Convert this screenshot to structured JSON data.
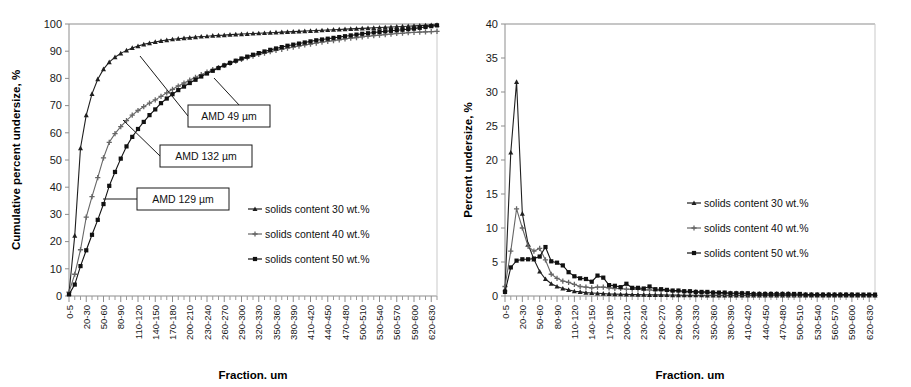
{
  "figure": {
    "panels": [
      "cumulative-undersize-chart",
      "percent-undersize-chart"
    ]
  },
  "chart_data": [
    {
      "id": "left",
      "type": "line",
      "title": "",
      "xlabel": "Fraction. um",
      "ylabel": "Cumulative percent undersize, %",
      "ylim": [
        0,
        100
      ],
      "ytick_labels": [
        "0",
        "10",
        "20",
        "30",
        "40",
        "50",
        "60",
        "70",
        "80",
        "90",
        "100"
      ],
      "yticks": [
        0,
        10,
        20,
        30,
        40,
        50,
        60,
        70,
        80,
        90,
        100
      ],
      "grid": false,
      "legend_position": "right-middle",
      "categories": [
        "0-5",
        "5-10",
        "10-20",
        "20-30",
        "30-40",
        "40-50",
        "50-60",
        "60-70",
        "70-80",
        "80-90",
        "90-100",
        "100-110",
        "110-120",
        "120-130",
        "130-140",
        "140-150",
        "150-160",
        "160-170",
        "170-180",
        "180-190",
        "190-200",
        "200-210",
        "210-220",
        "220-230",
        "230-240",
        "240-250",
        "250-260",
        "260-270",
        "270-280",
        "280-290",
        "290-300",
        "300-310",
        "310-320",
        "320-330",
        "330-340",
        "340-350",
        "350-360",
        "360-370",
        "370-380",
        "380-390",
        "390-400",
        "400-410",
        "410-420",
        "420-430",
        "430-440",
        "440-450",
        "450-460",
        "460-470",
        "470-480",
        "480-490",
        "490-500",
        "500-510",
        "510-520",
        "520-530",
        "530-540",
        "540-550",
        "550-560",
        "560-570",
        "570-580",
        "580-590",
        "590-600",
        "600-610",
        "610-620",
        "620-630",
        "630-640"
      ],
      "xtick_labels": [
        "0-5",
        "20-30",
        "50-60",
        "80-90",
        "110-120",
        "140-150",
        "170-180",
        "200-210",
        "230-240",
        "260-270",
        "290-300",
        "320-330",
        "350-360",
        "380-390",
        "410-420",
        "440-450",
        "470-480",
        "500-510",
        "530-540",
        "560-570",
        "590-600",
        "620-630"
      ],
      "xtick_indices": [
        0,
        3,
        6,
        9,
        12,
        15,
        18,
        21,
        24,
        27,
        30,
        33,
        36,
        39,
        42,
        45,
        48,
        51,
        54,
        57,
        60,
        63
      ],
      "series": [
        {
          "name": "solids content 30 wt.%",
          "marker": "triangle",
          "color": "#1f1f1f",
          "values": [
            1.0,
            22.2,
            54.4,
            66.5,
            74.3,
            79.7,
            83.4,
            86.0,
            87.8,
            89.2,
            90.3,
            91.2,
            91.9,
            92.5,
            93.0,
            93.4,
            93.8,
            94.1,
            94.4,
            94.6,
            94.8,
            95.0,
            95.2,
            95.4,
            95.5,
            95.7,
            95.8,
            95.9,
            96.1,
            96.2,
            96.3,
            96.4,
            96.5,
            96.6,
            96.7,
            96.8,
            96.9,
            97.0,
            97.1,
            97.2,
            97.3,
            97.4,
            97.5,
            97.6,
            97.7,
            97.8,
            97.9,
            98.0,
            98.1,
            98.2,
            98.3,
            98.4,
            98.5,
            98.6,
            98.7,
            98.8,
            98.9,
            99.0,
            99.1,
            99.2,
            99.3,
            99.4,
            99.5,
            99.6,
            99.7
          ]
        },
        {
          "name": "solids content 40 wt.%",
          "marker": "cross",
          "color": "#666666",
          "values": [
            1.4,
            8.0,
            17.0,
            29.0,
            36.5,
            43.5,
            50.8,
            56.5,
            59.7,
            62.3,
            64.5,
            66.5,
            68.2,
            69.6,
            70.9,
            72.1,
            73.4,
            74.7,
            76.0,
            77.2,
            78.3,
            79.4,
            80.4,
            81.4,
            82.3,
            83.2,
            84.0,
            84.8,
            85.6,
            86.3,
            87.0,
            87.6,
            88.2,
            88.8,
            89.3,
            89.8,
            90.3,
            90.7,
            91.1,
            91.5,
            91.9,
            92.3,
            92.6,
            93.0,
            93.3,
            93.6,
            93.9,
            94.2,
            94.5,
            94.8,
            95.0,
            95.3,
            95.5,
            95.7,
            95.9,
            96.1,
            96.3,
            96.5,
            96.6,
            96.8,
            96.9,
            97.0,
            97.1,
            97.2,
            97.3
          ]
        },
        {
          "name": "solids content 50 wt.%",
          "marker": "square",
          "color": "#111111",
          "values": [
            0.6,
            4.2,
            11.0,
            16.8,
            22.5,
            28.0,
            33.8,
            40.5,
            45.6,
            50.5,
            55.0,
            58.5,
            61.4,
            64.0,
            66.5,
            68.6,
            70.9,
            72.6,
            74.2,
            75.7,
            77.0,
            78.3,
            79.5,
            80.7,
            81.8,
            82.8,
            83.8,
            84.8,
            85.7,
            86.5,
            87.3,
            88.0,
            88.7,
            89.3,
            89.9,
            90.5,
            91.0,
            91.5,
            92.0,
            92.4,
            92.8,
            93.2,
            93.6,
            94.0,
            94.3,
            94.6,
            94.9,
            95.2,
            95.5,
            95.8,
            96.1,
            96.4,
            96.6,
            96.9,
            97.1,
            97.3,
            97.5,
            97.7,
            97.9,
            98.1,
            98.3,
            98.6,
            98.9,
            99.2,
            99.5
          ]
        }
      ],
      "annotations": [
        {
          "label": "AMD 49 µm",
          "box": {
            "x": 188,
            "y": 105,
            "w": 82,
            "h": 22
          },
          "leader": [
            [
              140,
              56
            ],
            [
              188,
              116
            ]
          ]
        },
        {
          "label": "AMD 132 µm",
          "box": {
            "x": 160,
            "y": 145,
            "w": 92,
            "h": 22
          },
          "leader": [
            [
              123,
              120
            ],
            [
              160,
              156
            ]
          ]
        },
        {
          "label": "AMD 129 µm",
          "box": {
            "x": 137,
            "y": 188,
            "w": 92,
            "h": 22
          },
          "leader": [
            [
              103,
              199
            ],
            [
              137,
              199
            ]
          ]
        }
      ],
      "extra_leaders": [
        [
          [
            240,
            106
          ],
          [
            214,
            78
          ]
        ]
      ]
    },
    {
      "id": "right",
      "type": "line",
      "title": "",
      "xlabel": "Fraction. um",
      "ylabel": "Percent undersize, %",
      "ylim": [
        0,
        40
      ],
      "ytick_labels": [
        "0",
        "5",
        "10",
        "15",
        "20",
        "25",
        "30",
        "35",
        "40"
      ],
      "yticks": [
        0,
        5,
        10,
        15,
        20,
        25,
        30,
        35,
        40
      ],
      "grid": false,
      "legend_position": "right-middle",
      "categories": [
        "0-5",
        "5-10",
        "10-20",
        "20-30",
        "30-40",
        "40-50",
        "50-60",
        "60-70",
        "70-80",
        "80-90",
        "90-100",
        "100-110",
        "110-120",
        "120-130",
        "130-140",
        "140-150",
        "150-160",
        "160-170",
        "170-180",
        "180-190",
        "190-200",
        "200-210",
        "210-220",
        "220-230",
        "230-240",
        "240-250",
        "250-260",
        "260-270",
        "270-280",
        "280-290",
        "290-300",
        "300-310",
        "310-320",
        "320-330",
        "330-340",
        "340-350",
        "350-360",
        "360-370",
        "370-380",
        "380-390",
        "390-400",
        "400-410",
        "410-420",
        "420-430",
        "430-440",
        "440-450",
        "450-460",
        "460-470",
        "470-480",
        "480-490",
        "490-500",
        "500-510",
        "510-520",
        "520-530",
        "530-540",
        "540-550",
        "550-560",
        "560-570",
        "570-580",
        "580-590",
        "590-600",
        "600-610",
        "610-620",
        "620-630",
        "630-640"
      ],
      "xtick_labels": [
        "0-5",
        "20-30",
        "50-60",
        "80-90",
        "110-120",
        "140-150",
        "170-180",
        "200-210",
        "230-240",
        "260-270",
        "290-300",
        "320-330",
        "350-360",
        "380-390",
        "410-420",
        "440-450",
        "470-480",
        "500-510",
        "530-540",
        "560-570",
        "590-600",
        "620-630"
      ],
      "xtick_indices": [
        0,
        3,
        6,
        9,
        12,
        15,
        18,
        21,
        24,
        27,
        30,
        33,
        36,
        39,
        42,
        45,
        48,
        51,
        54,
        57,
        60,
        63
      ],
      "series": [
        {
          "name": "solids content 30 wt.%",
          "marker": "triangle",
          "color": "#1f1f1f",
          "values": [
            1.0,
            21.1,
            31.5,
            12.1,
            7.6,
            5.4,
            3.6,
            2.5,
            1.8,
            1.4,
            1.1,
            0.9,
            0.7,
            0.6,
            0.5,
            0.45,
            0.4,
            0.35,
            0.3,
            0.28,
            0.26,
            0.24,
            0.22,
            0.2,
            0.19,
            0.18,
            0.17,
            0.16,
            0.15,
            0.14,
            0.13,
            0.12,
            0.12,
            0.11,
            0.11,
            0.1,
            0.1,
            0.1,
            0.1,
            0.1,
            0.1,
            0.1,
            0.1,
            0.1,
            0.1,
            0.1,
            0.1,
            0.1,
            0.1,
            0.1,
            0.1,
            0.1,
            0.1,
            0.1,
            0.1,
            0.1,
            0.1,
            0.1,
            0.1,
            0.1,
            0.1,
            0.1,
            0.1,
            0.1,
            0.1
          ]
        },
        {
          "name": "solids content 40 wt.%",
          "marker": "cross",
          "color": "#666666",
          "values": [
            1.4,
            6.6,
            12.8,
            10.0,
            7.3,
            6.6,
            7.0,
            5.3,
            3.2,
            2.6,
            2.2,
            2.0,
            1.7,
            1.4,
            1.3,
            1.2,
            1.3,
            1.3,
            1.2,
            1.1,
            1.1,
            1.0,
            1.0,
            1.0,
            0.9,
            0.9,
            0.8,
            0.8,
            0.8,
            0.7,
            0.7,
            0.6,
            0.6,
            0.6,
            0.5,
            0.5,
            0.5,
            0.4,
            0.4,
            0.4,
            0.4,
            0.4,
            0.3,
            0.3,
            0.3,
            0.3,
            0.3,
            0.3,
            0.3,
            0.3,
            0.2,
            0.2,
            0.2,
            0.2,
            0.2,
            0.2,
            0.2,
            0.2,
            0.2,
            0.2,
            0.2,
            0.1,
            0.1,
            0.1,
            0.1
          ]
        },
        {
          "name": "solids content 50 wt.%",
          "marker": "square",
          "color": "#111111",
          "values": [
            0.6,
            4.2,
            5.2,
            5.4,
            5.4,
            5.5,
            5.8,
            7.2,
            5.1,
            4.9,
            4.5,
            3.5,
            2.9,
            2.6,
            2.5,
            2.1,
            3.0,
            2.7,
            1.6,
            1.5,
            1.3,
            1.8,
            1.2,
            1.2,
            1.1,
            1.4,
            1.0,
            1.0,
            0.9,
            0.8,
            0.8,
            0.7,
            0.7,
            0.6,
            0.6,
            0.6,
            0.5,
            0.5,
            0.5,
            0.4,
            0.4,
            0.4,
            0.4,
            0.3,
            0.3,
            0.3,
            0.3,
            0.3,
            0.3,
            0.3,
            0.3,
            0.3,
            0.2,
            0.2,
            0.2,
            0.2,
            0.2,
            0.2,
            0.2,
            0.2,
            0.2,
            0.2,
            0.2,
            0.2,
            0.2
          ]
        }
      ],
      "annotations": [],
      "extra_leaders": []
    }
  ]
}
